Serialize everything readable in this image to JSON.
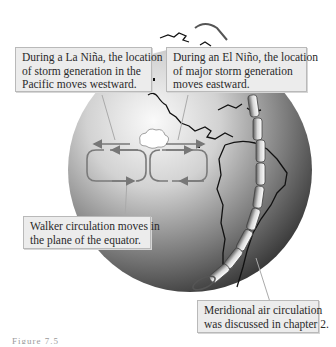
{
  "figure": {
    "type": "illustration",
    "colors": {
      "globe_light": "#f2f2f2",
      "globe_dark": "#3a3a3a",
      "coastline": "#111111",
      "circulation_arrow": "#7a7a7a",
      "callout_bg": "#ececec",
      "callout_border": "#b9b9b9"
    }
  },
  "callouts": {
    "la_nina": {
      "lines": [
        "During a La Niña, the location",
        "of storm generation in the",
        "Pacific moves westward."
      ]
    },
    "el_nino": {
      "lines": [
        "During an El Niño, the location",
        "of major storm generation",
        "moves eastward."
      ]
    },
    "walker": {
      "lines": [
        "Walker circulation moves in",
        "the plane of the equator."
      ]
    },
    "meridional": {
      "lines": [
        "Meridional air circulation",
        "was discussed in chapter 2."
      ]
    }
  },
  "diagram": {
    "arrows": {
      "west_arrow": "storm generation shift westward",
      "east_arrow": "storm generation shift eastward"
    },
    "cells": [
      "west walker cell",
      "east walker cell"
    ],
    "cloud": "storm cloud",
    "meridional_band": "meridional circulation cells"
  },
  "caption": {
    "text": "Figure 7.5"
  }
}
